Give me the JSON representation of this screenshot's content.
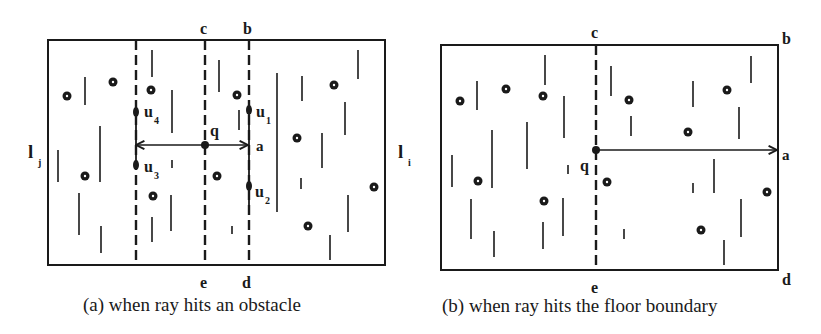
{
  "colors": {
    "ink": "#1a1a1a",
    "background": "#ffffff"
  },
  "panel_a": {
    "caption": "(a) when ray hits an obstacle",
    "frame": {
      "x1": 48,
      "y1": 40,
      "x2": 385,
      "y2": 265
    },
    "side_labels": {
      "left": "l",
      "left_sub": "j",
      "right": "l",
      "right_sub": "i"
    },
    "dashed_lines": [
      {
        "name": "u-left",
        "x": 136
      },
      {
        "name": "ce",
        "x": 205,
        "top_label": "c",
        "bottom_label": "e"
      },
      {
        "name": "bd",
        "x": 249,
        "top_label": "b",
        "bottom_label": "d"
      }
    ],
    "ray": {
      "y": 145,
      "x_from": 136,
      "x_to": 249,
      "origin_label": "q",
      "hit_label": "a"
    },
    "points": [
      {
        "label": "u",
        "sub": "4",
        "x": 136,
        "y": 112
      },
      {
        "label": "u",
        "sub": "3",
        "x": 136,
        "y": 165
      },
      {
        "label": "u",
        "sub": "1",
        "x": 249,
        "y": 110
      },
      {
        "label": "u",
        "sub": "2",
        "x": 249,
        "y": 186
      }
    ],
    "obstacles_dots": [
      [
        67,
        96
      ],
      [
        113,
        82
      ],
      [
        151,
        90
      ],
      [
        85,
        176
      ],
      [
        153,
        196
      ],
      [
        237,
        95
      ],
      [
        217,
        176
      ],
      [
        297,
        138
      ],
      [
        334,
        85
      ],
      [
        374,
        187
      ],
      [
        308,
        226
      ]
    ],
    "obstacles_segments": [
      [
        85,
        77,
        105
      ],
      [
        152,
        50,
        77
      ],
      [
        172,
        90,
        133
      ],
      [
        219,
        60,
        92
      ],
      [
        239,
        110,
        130
      ],
      [
        277,
        73,
        212
      ],
      [
        58,
        150,
        182
      ],
      [
        100,
        126,
        182
      ],
      [
        79,
        193,
        235
      ],
      [
        101,
        226,
        253
      ],
      [
        172,
        160,
        168
      ],
      [
        152,
        217,
        242
      ],
      [
        171,
        195,
        231
      ],
      [
        232,
        226,
        234
      ],
      [
        302,
        76,
        101
      ],
      [
        322,
        133,
        168
      ],
      [
        301,
        178,
        189
      ],
      [
        358,
        50,
        79
      ],
      [
        345,
        102,
        135
      ],
      [
        348,
        195,
        232
      ],
      [
        330,
        235,
        260
      ]
    ]
  },
  "panel_b": {
    "caption": "(b) when ray hits the floor boundary",
    "frame": {
      "x1": 441,
      "y1": 45,
      "x2": 778,
      "y2": 270
    },
    "dashed_lines": [
      {
        "name": "ce",
        "x": 596,
        "top_label": "c",
        "bottom_label": "e"
      }
    ],
    "corner_labels": {
      "top_right": "b",
      "bottom_right": "d"
    },
    "ray": {
      "y": 150,
      "x_from": 596,
      "x_to": 778,
      "origin_label": "q",
      "hit_label": "a"
    },
    "obstacles_dots": [
      [
        460,
        101
      ],
      [
        506,
        89
      ],
      [
        543,
        96
      ],
      [
        629,
        100
      ],
      [
        727,
        90
      ],
      [
        688,
        132
      ],
      [
        478,
        181
      ],
      [
        544,
        201
      ],
      [
        607,
        182
      ],
      [
        767,
        192
      ],
      [
        701,
        230
      ]
    ],
    "obstacles_segments": [
      [
        477,
        81,
        110
      ],
      [
        545,
        55,
        85
      ],
      [
        492,
        130,
        188
      ],
      [
        527,
        122,
        169
      ],
      [
        564,
        96,
        138
      ],
      [
        452,
        155,
        187
      ],
      [
        471,
        199,
        239
      ],
      [
        494,
        231,
        257
      ],
      [
        568,
        165,
        174
      ],
      [
        543,
        222,
        249
      ],
      [
        563,
        198,
        236
      ],
      [
        611,
        66,
        96
      ],
      [
        631,
        116,
        136
      ],
      [
        693,
        81,
        107
      ],
      [
        751,
        56,
        83
      ],
      [
        739,
        107,
        139
      ],
      [
        714,
        159,
        193
      ],
      [
        693,
        183,
        193
      ],
      [
        741,
        199,
        237
      ],
      [
        724,
        240,
        265
      ],
      [
        624,
        229,
        239
      ]
    ]
  }
}
